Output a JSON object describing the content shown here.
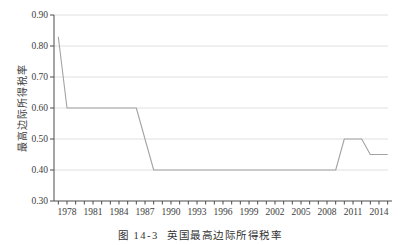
{
  "figure": {
    "caption": "图 14-3  英国最高边际所得税率"
  },
  "chart_data": {
    "type": "line",
    "title": "",
    "xlabel": "",
    "ylabel": "最高边际所得税率",
    "series": [
      {
        "name": "英国最高边际所得税率",
        "points": [
          [
            1977,
            0.83
          ],
          [
            1978,
            0.6
          ],
          [
            1986,
            0.6
          ],
          [
            1988,
            0.4
          ],
          [
            2009,
            0.4
          ],
          [
            2010,
            0.5
          ],
          [
            2012,
            0.5
          ],
          [
            2013,
            0.45
          ],
          [
            2015,
            0.45
          ]
        ]
      }
    ],
    "x_axis": {
      "minor_tick_start": 1977,
      "minor_tick_end": 2015,
      "minor_tick_step": 1,
      "labeled_ticks": [
        1978,
        1981,
        1984,
        1987,
        1990,
        1993,
        1996,
        1999,
        2002,
        2005,
        2008,
        2011,
        2014
      ]
    },
    "y_axis": {
      "ticks": [
        0.3,
        0.4,
        0.5,
        0.6,
        0.7,
        0.8,
        0.9
      ],
      "tick_decimals": 2,
      "ylim": [
        0.3,
        0.9
      ]
    },
    "grid": {
      "horizontal_levels": [
        0.4,
        0.5,
        0.6,
        0.7,
        0.8,
        0.9
      ],
      "vertical": false
    },
    "legend": "none",
    "colors": {
      "background": "#ffffff",
      "grid": "#dcdcdc",
      "axis": "#4d4d4d",
      "line": "#a3a3a3",
      "tick_text": "#3d3d3d"
    }
  }
}
